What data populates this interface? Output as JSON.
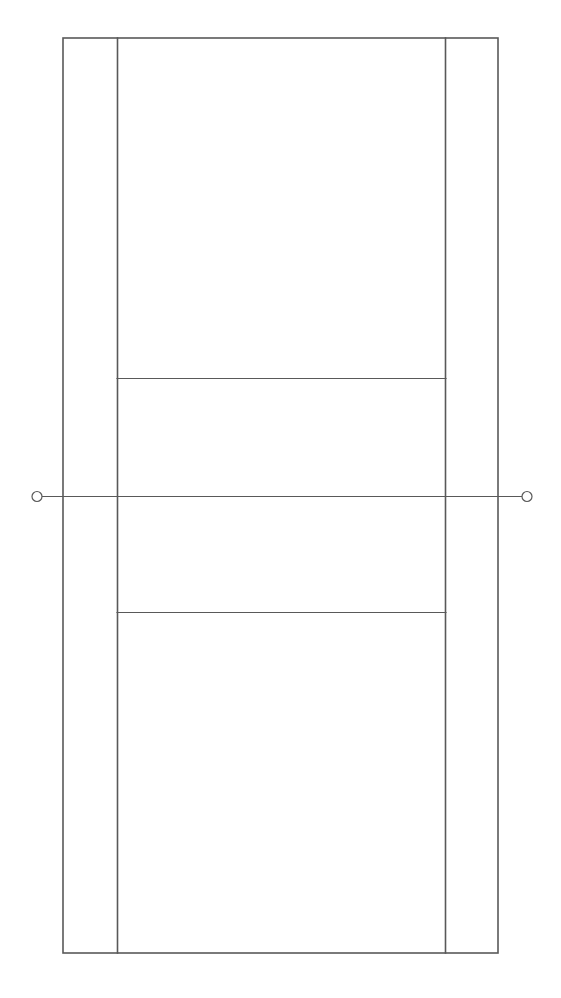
{
  "diagram": {
    "type": "tennis-court-line-diagram",
    "canvas": {
      "width": 561,
      "height": 998,
      "background": "#ffffff"
    },
    "stroke": {
      "color": "#595959",
      "net_color": "#595959",
      "court_line_width": 1.6,
      "net_line_width": 1.0,
      "post_line_width": 1.2
    },
    "geometry": {
      "doubles_left_x": 63,
      "doubles_right_x": 498,
      "singles_left_x": 117,
      "singles_right_x": 445,
      "baseline_top_y": 38,
      "baseline_bottom_y": 953,
      "service_line_top_y": 378,
      "service_line_bottom_y": 612,
      "net_y": 496,
      "net_post_left_x": 37,
      "net_post_right_x": 527,
      "net_post_radius": 5
    },
    "elements": {
      "outer_boundary_label": "Doubles court boundary",
      "singles_left_label": "Left singles sideline",
      "singles_right_label": "Right singles sideline",
      "service_line_top_label": "Far service line",
      "service_line_bottom_label": "Near service line",
      "net_label": "Net line",
      "net_post_left_label": "Left net post",
      "net_post_right_label": "Right net post",
      "alley_left_label": "Left doubles alley",
      "alley_right_label": "Right doubles alley"
    },
    "annotations": []
  }
}
